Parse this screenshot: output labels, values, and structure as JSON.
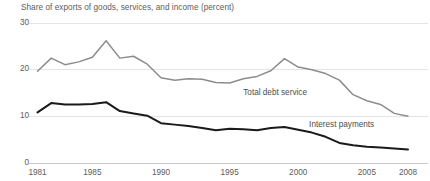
{
  "chart_data": {
    "type": "line",
    "title": "Share of exports of goods, services, and income (percent)",
    "xlabel": "",
    "ylabel": "Share of exports of goods, services, and income (percent)",
    "xlim": [
      1981,
      2008
    ],
    "ylim": [
      0,
      30
    ],
    "yticks": [
      0,
      10,
      20,
      30
    ],
    "ytick_labels": [
      "0",
      "10",
      "20",
      "30"
    ],
    "xticks": [
      1981,
      1985,
      1990,
      1995,
      2000,
      2005,
      2008
    ],
    "xtick_labels": [
      "1981",
      "1985",
      "1990",
      "1995",
      "2000",
      "2005",
      "2008"
    ],
    "grid": "horizontal",
    "legend_position": "inline-annotation",
    "x": [
      1981,
      1982,
      1983,
      1984,
      1985,
      1986,
      1987,
      1988,
      1989,
      1990,
      1991,
      1992,
      1993,
      1994,
      1995,
      1996,
      1997,
      1998,
      1999,
      2000,
      2001,
      2002,
      2003,
      2004,
      2005,
      2006,
      2007,
      2008
    ],
    "series": [
      {
        "name": "Total debt service",
        "color": "#8c8c8c",
        "values": [
          19.7,
          22.5,
          21.1,
          21.7,
          22.7,
          26.2,
          22.5,
          22.9,
          21.2,
          18.3,
          17.8,
          18.1,
          18.0,
          17.3,
          17.2,
          18.1,
          18.6,
          19.8,
          22.4,
          20.6,
          20.0,
          19.2,
          17.8,
          14.7,
          13.4,
          12.6,
          10.7,
          10.1
        ]
      },
      {
        "name": "Interest payments",
        "color": "#1a1a1a",
        "values": [
          10.9,
          12.9,
          12.6,
          12.6,
          12.7,
          13.1,
          11.2,
          10.7,
          10.2,
          8.6,
          8.3,
          8.0,
          7.6,
          7.1,
          7.4,
          7.3,
          7.1,
          7.6,
          7.8,
          7.2,
          6.6,
          5.7,
          4.4,
          3.9,
          3.6,
          3.4,
          3.2,
          3.0
        ]
      }
    ],
    "annotations": [
      {
        "text": "Total debt service",
        "x": 1999.2,
        "y": 15.0
      },
      {
        "text": "Interest payments",
        "x": 2004.0,
        "y": 8.2
      }
    ]
  }
}
